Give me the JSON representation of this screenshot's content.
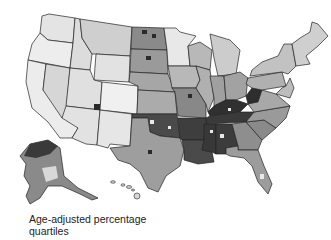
{
  "map": {
    "title": "Age-adjusted percentage quartiles",
    "caption_line1": "Age-adjusted percentage",
    "caption_line2": "quartiles",
    "region": "United States counties",
    "legend_quartile_colors": [
      "#f0f0f0",
      "#c8c8c8",
      "#8c8c8c",
      "#3c3c3c"
    ],
    "state_shading": {
      "west": "#e6e6e6",
      "plains": "#a8a8a8",
      "midwest": "#b4b4b4",
      "south": "#4a4a4a",
      "appalachia": "#3a3a3a",
      "southeast": "#9a9a9a",
      "northeast": "#c4c4c4",
      "alaska": "#8a8a8a",
      "hawaii": "#d8d8d8"
    }
  }
}
